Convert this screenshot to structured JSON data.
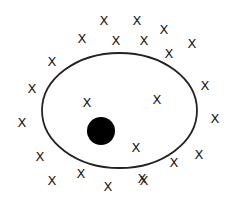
{
  "diagram": {
    "ellipse": {
      "cx": 119.5,
      "cy": 110.5,
      "rx": 77.5,
      "ry": 57.5,
      "stroke": "#222222",
      "fill": "none"
    },
    "dot": {
      "cx": 101,
      "cy": 131,
      "r": 14,
      "fill": "#000000"
    },
    "marker_glyph": "X",
    "marker_color": "#222222",
    "markers_inside": [
      {
        "x": 87,
        "y": 102
      },
      {
        "x": 157,
        "y": 99
      },
      {
        "x": 136,
        "y": 147
      }
    ],
    "markers_outside": [
      {
        "x": 104,
        "y": 20
      },
      {
        "x": 137,
        "y": 20
      },
      {
        "x": 164,
        "y": 29
      },
      {
        "x": 82,
        "y": 38
      },
      {
        "x": 116,
        "y": 40
      },
      {
        "x": 144,
        "y": 40
      },
      {
        "x": 192,
        "y": 43
      },
      {
        "x": 169,
        "y": 53
      },
      {
        "x": 52,
        "y": 61
      },
      {
        "x": 32,
        "y": 88
      },
      {
        "x": 205,
        "y": 85
      },
      {
        "x": 22,
        "y": 122
      },
      {
        "x": 215,
        "y": 118
      },
      {
        "x": 40,
        "y": 156
      },
      {
        "x": 199,
        "y": 154
      },
      {
        "x": 174,
        "y": 162
      },
      {
        "x": 81,
        "y": 173
      },
      {
        "x": 52,
        "y": 180
      },
      {
        "x": 144,
        "y": 180
      },
      {
        "x": 108,
        "y": 186
      },
      {
        "x": 142,
        "y": 178
      }
    ]
  }
}
